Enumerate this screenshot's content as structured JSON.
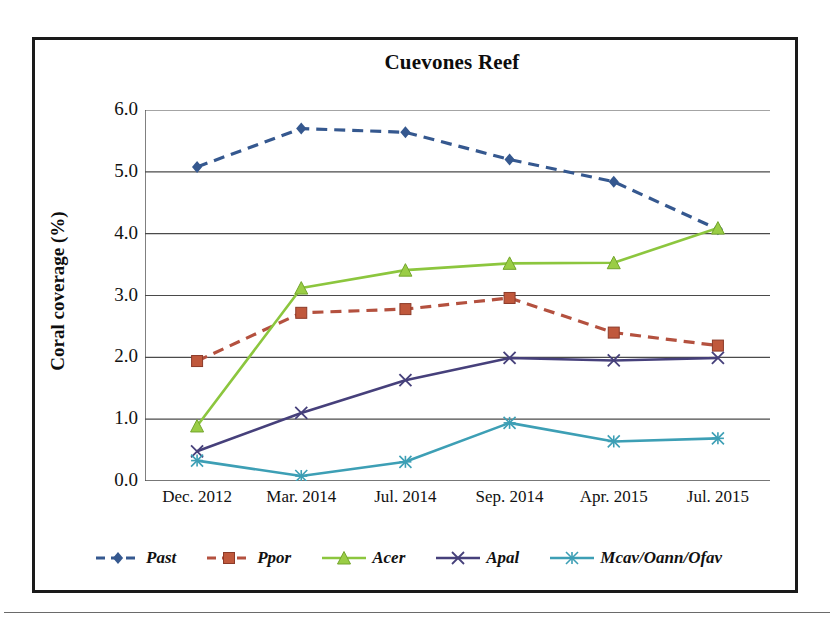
{
  "chart_data": {
    "type": "line",
    "title": "Cuevones Reef",
    "xlabel": "",
    "ylabel": "Coral coverage (%)",
    "ylim": [
      0.0,
      6.0
    ],
    "ytick_labels": [
      "6.0",
      "5.0",
      "4.0",
      "3.0",
      "2.0",
      "1.0",
      "0.0"
    ],
    "grid": true,
    "legend_position": "bottom",
    "categories": [
      "Dec. 2012",
      "Mar. 2014",
      "Jul. 2014",
      "Sep. 2014",
      "Apr. 2015",
      "Jul. 2015"
    ],
    "series": [
      {
        "name": "Past",
        "color": "#35588F",
        "marker": "diamond",
        "dash": "dashed",
        "values": [
          5.08,
          5.7,
          5.64,
          5.2,
          4.84,
          4.07
        ]
      },
      {
        "name": "Ppor",
        "color": "#B4513F",
        "marker": "square",
        "dash": "dashed",
        "values": [
          1.94,
          2.72,
          2.78,
          2.96,
          2.4,
          2.19
        ]
      },
      {
        "name": "Acer",
        "color": "#8CC63E",
        "marker": "triangle",
        "dash": "solid",
        "values": [
          0.89,
          3.12,
          3.41,
          3.52,
          3.53,
          4.09
        ]
      },
      {
        "name": "Apal",
        "color": "#46407B",
        "marker": "cross",
        "dash": "solid",
        "values": [
          0.48,
          1.1,
          1.63,
          1.99,
          1.95,
          1.99
        ]
      },
      {
        "name": "Mcav/Oann/Ofav",
        "color": "#3D9FB5",
        "marker": "asterisk",
        "dash": "solid",
        "values": [
          0.33,
          0.08,
          0.31,
          0.94,
          0.64,
          0.69
        ]
      }
    ]
  }
}
